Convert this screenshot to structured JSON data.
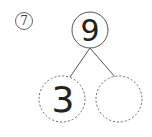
{
  "problem": {
    "number": "7"
  },
  "number_bond": {
    "whole": "9",
    "parts": [
      "3",
      ""
    ]
  },
  "colors": {
    "stroke": "#555555",
    "text": "#222222"
  }
}
